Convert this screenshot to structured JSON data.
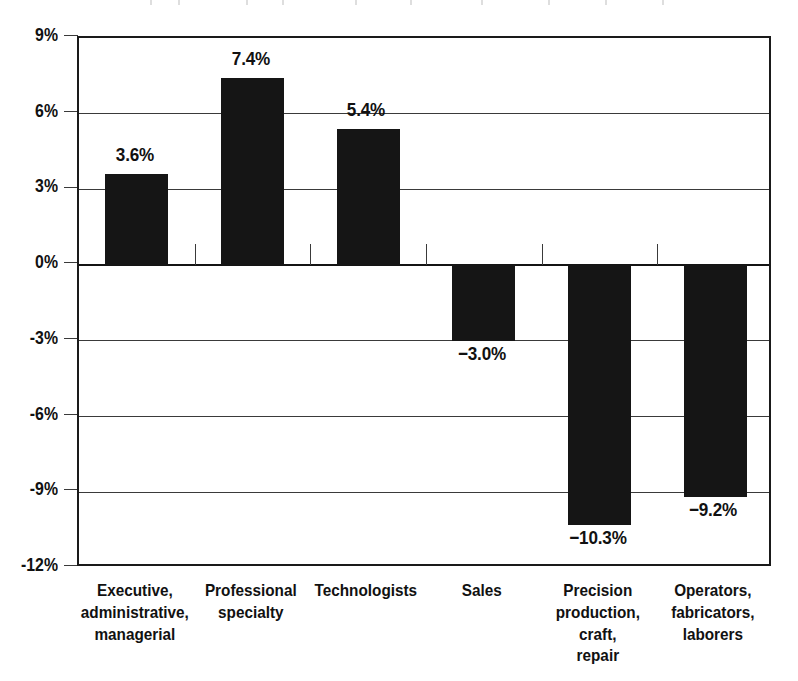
{
  "chart_data": {
    "type": "bar",
    "title": "",
    "xlabel": "",
    "ylabel": "",
    "categories": [
      "Executive, administrative, managerial",
      "Professional specialty",
      "Technologists",
      "Sales",
      "Precision production, craft, repair",
      "Operators, fabricators, laborers"
    ],
    "category_lines": [
      [
        "Executive,",
        "administrative,",
        "managerial"
      ],
      [
        "Professional",
        "specialty"
      ],
      [
        "Technologists"
      ],
      [
        "Sales"
      ],
      [
        "Precision",
        "production, craft,",
        "repair"
      ],
      [
        "Operators,",
        "fabricators,",
        "laborers"
      ]
    ],
    "values": [
      3.6,
      7.4,
      5.4,
      -3.0,
      -10.3,
      -9.2
    ],
    "value_labels": [
      "3.6%",
      "7.4%",
      "5.4%",
      "−3.0%",
      "−10.3%",
      "−9.2%"
    ],
    "ylim": [
      -12,
      9
    ],
    "ytick_values": [
      9,
      6,
      3,
      0,
      -3,
      -6,
      -9,
      -12
    ],
    "ytick_labels": [
      "9%",
      "6%",
      "3%",
      "0%",
      "-3%",
      "-6%",
      "-9%",
      "-12%"
    ],
    "grid": true,
    "legend": null,
    "legend_position": "none",
    "bar_color": "#151515",
    "axis_color": "#1a1a1a",
    "grid_color": "#3a3a3a",
    "background_color": "#ffffff"
  }
}
